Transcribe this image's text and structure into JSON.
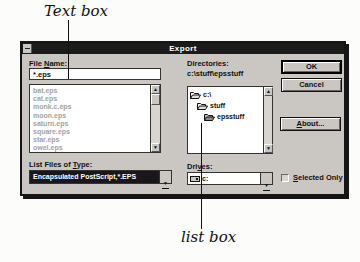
{
  "annotations": {
    "textbox_label": "Text box",
    "listbox_label": "list box"
  },
  "dialog": {
    "title": "Export",
    "file_name": {
      "label_pre": "File ",
      "label_key": "N",
      "label_post": "ame:",
      "value": "*.eps"
    },
    "file_list": [
      "bat.eps",
      "cat.eps",
      "monk.c.eps",
      "moon.eps",
      "saturn.eps",
      "square.eps",
      "star.eps",
      "owel.eps"
    ],
    "list_files_of_type": {
      "label_pre": "List Files of ",
      "label_key": "T",
      "label_post": "ype:",
      "value": "Encapsulated PostScript,*.EPS"
    },
    "directories": {
      "label": "Directories:",
      "path": "c:\\stuff\\epsstuff",
      "tree": [
        {
          "name": "c:\\"
        },
        {
          "name": "stuff"
        },
        {
          "name": "epsstuff"
        }
      ]
    },
    "drives": {
      "label_pre": "Dri",
      "label_key": "v",
      "label_post": "es:",
      "value": "c:"
    },
    "buttons": {
      "ok": "OK",
      "cancel": "Cancel",
      "about_pre": "",
      "about_key": "A",
      "about_post": "bout..."
    },
    "selected_only": {
      "label_pre": "",
      "label_key": "S",
      "label_post": "elected Only"
    }
  },
  "colors": {
    "dialog_bg": "#cac7c2",
    "titlebar_bg": "#1b1b1b",
    "titlebar_text": "#ffffff",
    "selection_bg": "#17171c",
    "selection_text": "#ffffff",
    "grayed_text": "#a2a2a2",
    "border": "#151515"
  }
}
